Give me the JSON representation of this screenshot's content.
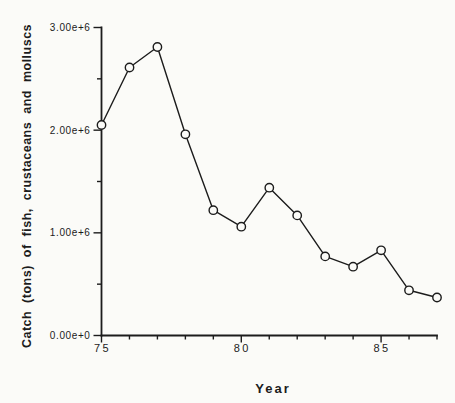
{
  "chart_data": {
    "type": "line",
    "title": "",
    "xlabel": "Year",
    "ylabel": "Catch (tons) of fish, crustaceans and molluscs",
    "x": [
      75,
      76,
      77,
      78,
      79,
      80,
      81,
      82,
      83,
      84,
      85,
      86,
      87
    ],
    "values": [
      2050000,
      2610000,
      2810000,
      1960000,
      1220000,
      1060000,
      1440000,
      1170000,
      770000,
      670000,
      830000,
      440000,
      370000
    ],
    "xlim": [
      75,
      87
    ],
    "ylim": [
      0,
      3000000
    ],
    "x_major_ticks": [
      75,
      80,
      85
    ],
    "x_tick_labels": [
      "75",
      "80",
      "85"
    ],
    "x_minor_step": 1,
    "y_major_ticks": [
      0,
      1000000,
      2000000,
      3000000
    ],
    "y_tick_labels": [
      "0.00e+0",
      "1.00e+6",
      "2.00e+6",
      "3.00e+6"
    ],
    "y_minor_step": 500000,
    "grid": false,
    "legend": null,
    "marker": "open-circle",
    "line_color": "#1c1c1c",
    "marker_fill": "#fbfbf8",
    "text_color": "#1c1c1c",
    "background_color": "#fbfbf8"
  }
}
